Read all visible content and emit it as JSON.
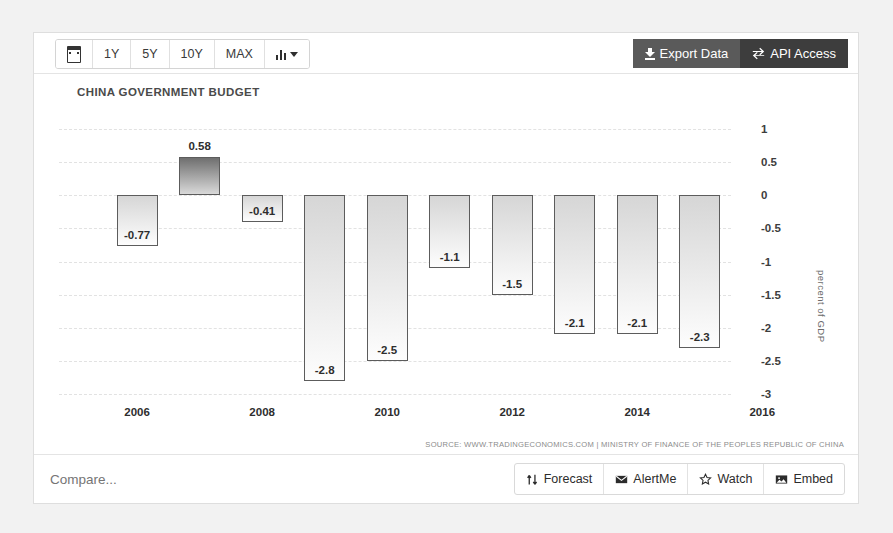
{
  "toolbar": {
    "calendar_icon": "calendar-icon",
    "ranges": [
      {
        "label": "1Y"
      },
      {
        "label": "5Y"
      },
      {
        "label": "10Y"
      },
      {
        "label": "MAX"
      }
    ],
    "chart_type_icon": "bar-chart-icon",
    "export_label": "Export Data",
    "api_label": "API Access",
    "export_icon": "download-icon",
    "api_icon": "exchange-icon"
  },
  "chart_data": {
    "type": "bar",
    "title": "CHINA GOVERNMENT BUDGET",
    "xlabel": "",
    "ylabel": "percent of GDP",
    "categories": [
      2006,
      2007,
      2008,
      2009,
      2010,
      2011,
      2012,
      2013,
      2014,
      2015
    ],
    "values": [
      -0.77,
      0.58,
      -0.41,
      -2.8,
      -2.5,
      -1.1,
      -1.5,
      -2.1,
      -2.1,
      -2.3
    ],
    "value_labels": [
      "-0.77",
      "0.58",
      "-0.41",
      "-2.8",
      "-2.5",
      "-1.1",
      "-1.5",
      "-2.1",
      "-2.1",
      "-2.3"
    ],
    "ylim": [
      -3,
      1
    ],
    "yticks": [
      1,
      0.5,
      0,
      -0.5,
      -1,
      -1.5,
      -2,
      -2.5,
      -3
    ],
    "ytick_labels": [
      "1",
      "0.5",
      "0",
      "-0.5",
      "-1",
      "-1.5",
      "-2",
      "-2.5",
      "-3"
    ],
    "xticks": [
      2006,
      2008,
      2010,
      2012,
      2014,
      2016
    ],
    "xtick_labels": [
      "2006",
      "2008",
      "2010",
      "2012",
      "2014",
      "2016"
    ],
    "grid": true,
    "legend": "none",
    "source": "SOURCE: WWW.TRADINGECONOMICS.COM | MINISTRY OF FINANCE OF THE PEOPLES REPUBLIC OF CHINA",
    "colors": {
      "positive_bar": "#6f6f6f",
      "negative_bar": "#d6d6d6",
      "bar_border": "#5c5c5c",
      "grid": "#e2e2e2"
    }
  },
  "footer": {
    "compare_placeholder": "Compare...",
    "buttons": [
      {
        "label": "Forecast",
        "icon": "forecast-arrows-icon"
      },
      {
        "label": "AlertMe",
        "icon": "envelope-icon"
      },
      {
        "label": "Watch",
        "icon": "star-icon"
      },
      {
        "label": "Embed",
        "icon": "image-icon"
      }
    ]
  }
}
